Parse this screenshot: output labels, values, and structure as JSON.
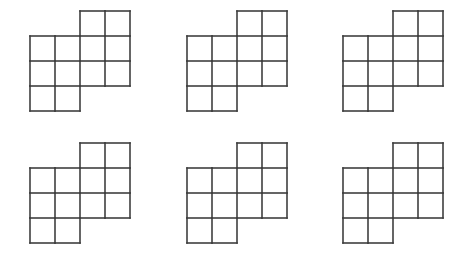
{
  "canvas": {
    "width": 463,
    "height": 263,
    "background_color": "#ffffff"
  },
  "style": {
    "stroke_color": "#3f3f3f",
    "stroke_width": 1.6,
    "cell_fill": "#ffffff",
    "cell_size": 25
  },
  "layout": {
    "columns": 3,
    "rows": 2,
    "origins": [
      {
        "x": 30,
        "y": 11
      },
      {
        "x": 187,
        "y": 11
      },
      {
        "x": 343,
        "y": 11
      },
      {
        "x": 30,
        "y": 143
      },
      {
        "x": 187,
        "y": 143
      },
      {
        "x": 343,
        "y": 143
      }
    ]
  },
  "chart_data": {
    "type": "table",
    "title": "",
    "xlabel": "",
    "ylabel": "",
    "grid_rows": 4,
    "grid_cols": 4,
    "cell_count": 10,
    "shapes": [
      {
        "index": 1,
        "name": "polyomino-1",
        "cells": [
          [
            0,
            2
          ],
          [
            0,
            3
          ],
          [
            1,
            0
          ],
          [
            1,
            1
          ],
          [
            1,
            2
          ],
          [
            1,
            3
          ],
          [
            2,
            0
          ],
          [
            2,
            1
          ],
          [
            2,
            2
          ],
          [
            2,
            3
          ],
          [
            3,
            0
          ],
          [
            3,
            1
          ]
        ]
      },
      {
        "index": 2,
        "name": "polyomino-2",
        "cells": [
          [
            0,
            2
          ],
          [
            0,
            3
          ],
          [
            1,
            0
          ],
          [
            1,
            1
          ],
          [
            1,
            2
          ],
          [
            1,
            3
          ],
          [
            2,
            0
          ],
          [
            2,
            1
          ],
          [
            2,
            2
          ],
          [
            2,
            3
          ],
          [
            3,
            0
          ],
          [
            3,
            1
          ]
        ]
      },
      {
        "index": 3,
        "name": "polyomino-3",
        "cells": [
          [
            0,
            2
          ],
          [
            0,
            3
          ],
          [
            1,
            0
          ],
          [
            1,
            1
          ],
          [
            1,
            2
          ],
          [
            1,
            3
          ],
          [
            2,
            0
          ],
          [
            2,
            1
          ],
          [
            2,
            2
          ],
          [
            2,
            3
          ],
          [
            3,
            0
          ],
          [
            3,
            1
          ]
        ]
      },
      {
        "index": 4,
        "name": "polyomino-4",
        "cells": [
          [
            0,
            2
          ],
          [
            0,
            3
          ],
          [
            1,
            0
          ],
          [
            1,
            1
          ],
          [
            1,
            2
          ],
          [
            1,
            3
          ],
          [
            2,
            0
          ],
          [
            2,
            1
          ],
          [
            2,
            2
          ],
          [
            2,
            3
          ],
          [
            3,
            0
          ],
          [
            3,
            1
          ]
        ]
      },
      {
        "index": 5,
        "name": "polyomino-5",
        "cells": [
          [
            0,
            2
          ],
          [
            0,
            3
          ],
          [
            1,
            0
          ],
          [
            1,
            1
          ],
          [
            1,
            2
          ],
          [
            1,
            3
          ],
          [
            2,
            0
          ],
          [
            2,
            1
          ],
          [
            2,
            2
          ],
          [
            2,
            3
          ],
          [
            3,
            0
          ],
          [
            3,
            1
          ]
        ]
      },
      {
        "index": 6,
        "name": "polyomino-6",
        "cells": [
          [
            0,
            2
          ],
          [
            0,
            3
          ],
          [
            1,
            0
          ],
          [
            1,
            1
          ],
          [
            1,
            2
          ],
          [
            1,
            3
          ],
          [
            2,
            0
          ],
          [
            2,
            1
          ],
          [
            2,
            2
          ],
          [
            2,
            3
          ],
          [
            3,
            0
          ],
          [
            3,
            1
          ]
        ]
      }
    ]
  }
}
